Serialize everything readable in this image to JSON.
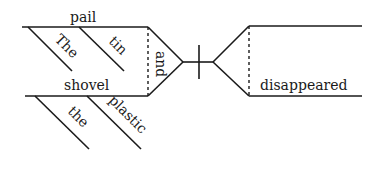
{
  "diagram": {
    "type": "sentence-diagram",
    "subject": {
      "top": {
        "noun": "pail",
        "modifiers": [
          "The",
          "tin"
        ]
      },
      "bottom": {
        "noun": "shovel",
        "modifiers": [
          "the",
          "plastic"
        ]
      },
      "conjunction": "and"
    },
    "predicate": {
      "verb": "disappeared"
    }
  }
}
